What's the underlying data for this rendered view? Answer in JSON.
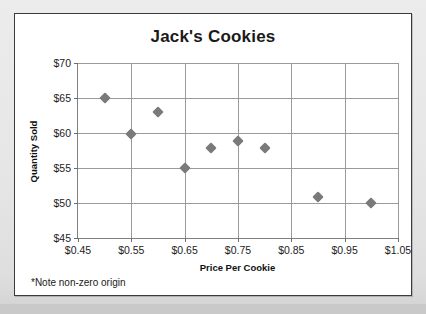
{
  "card": {
    "footnote": "*Note non-zero origin"
  },
  "chart_data": {
    "type": "scatter",
    "title": "Jack's Cookies",
    "xlabel": "Price Per Cookie",
    "ylabel": "Quantity Sold",
    "xlim": [
      0.45,
      1.05
    ],
    "ylim": [
      45,
      70
    ],
    "xticks": [
      0.45,
      0.55,
      0.65,
      0.75,
      0.85,
      0.95,
      1.05
    ],
    "xtick_labels": [
      "$0.45",
      "$0.55",
      "$0.65",
      "$0.75",
      "$0.85",
      "$0.95",
      "$1.05"
    ],
    "yticks": [
      45,
      50,
      55,
      60,
      65,
      70
    ],
    "ytick_labels": [
      "$45",
      "$50",
      "$55",
      "$60",
      "$65",
      "$70"
    ],
    "grid": true,
    "legend": null,
    "marker_shape": "diamond",
    "marker_color": "#7a7a7a",
    "points": [
      {
        "x": 0.5,
        "y": 65.0
      },
      {
        "x": 0.55,
        "y": 59.8
      },
      {
        "x": 0.6,
        "y": 63.0
      },
      {
        "x": 0.65,
        "y": 55.0
      },
      {
        "x": 0.7,
        "y": 57.8
      },
      {
        "x": 0.75,
        "y": 58.8
      },
      {
        "x": 0.8,
        "y": 57.8
      },
      {
        "x": 0.9,
        "y": 50.8
      },
      {
        "x": 1.0,
        "y": 50.0
      }
    ]
  }
}
